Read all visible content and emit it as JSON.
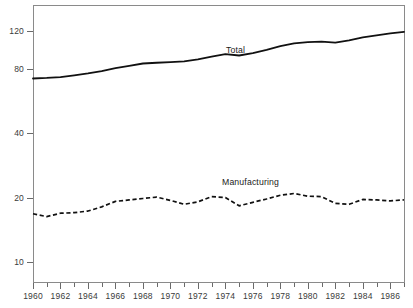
{
  "chart_data": {
    "type": "line",
    "title": "",
    "subtitle": "",
    "xlabel": "",
    "ylabel": "",
    "yscale": "log",
    "ylim": [
      8,
      140
    ],
    "xlim": [
      1960,
      1987
    ],
    "grid": false,
    "legend_position": "inline-annotation",
    "y_ticks": [
      {
        "value": 120,
        "label": "120"
      },
      {
        "value": 80,
        "label": "80"
      },
      {
        "value": 40,
        "label": "40"
      },
      {
        "value": 20,
        "label": "20"
      },
      {
        "value": 10,
        "label": "10"
      }
    ],
    "x_ticks_major": [
      "1960",
      "1962",
      "1964",
      "1966",
      "1968",
      "1970",
      "1972",
      "1974",
      "1976",
      "1978",
      "1980",
      "1982",
      "1984",
      "1986"
    ],
    "x_ticks_minor": [
      1961,
      1963,
      1965,
      1967,
      1969,
      1971,
      1973,
      1975,
      1977,
      1979,
      1981,
      1983,
      1985,
      1987
    ],
    "x": [
      1960,
      1961,
      1962,
      1963,
      1964,
      1965,
      1966,
      1967,
      1968,
      1969,
      1970,
      1971,
      1972,
      1973,
      1974,
      1975,
      1976,
      1977,
      1978,
      1979,
      1980,
      1981,
      1982,
      1983,
      1984,
      1985,
      1986,
      1987
    ],
    "series": [
      {
        "name": "Total",
        "style": "solid",
        "color": "#111111",
        "annotation": "Total",
        "values": [
          72.0,
          72.4,
          73.1,
          74.5,
          76.0,
          78.0,
          80.5,
          82.5,
          84.6,
          85.3,
          85.9,
          86.5,
          88.5,
          91.0,
          93.5,
          92.2,
          94.5,
          98.0,
          102.0,
          105.0,
          106.5,
          107.0,
          106.0,
          108.5,
          112.0,
          114.5,
          117.0,
          119.0
        ]
      },
      {
        "name": "Manufacturing",
        "style": "dashed",
        "color": "#111111",
        "annotation": "Manufacturing",
        "values": [
          16.8,
          16.3,
          16.9,
          17.0,
          17.3,
          18.1,
          19.2,
          19.5,
          19.8,
          20.1,
          19.4,
          18.6,
          19.1,
          20.2,
          20.0,
          18.3,
          19.0,
          19.7,
          20.5,
          20.9,
          20.3,
          20.2,
          18.8,
          18.6,
          19.6,
          19.5,
          19.3,
          19.5
        ]
      }
    ],
    "annotations": [
      {
        "text": "Total",
        "x_px": 226,
        "y_px": 46
      },
      {
        "text": "Manufacturing",
        "x_px": 222,
        "y_px": 178
      }
    ]
  }
}
